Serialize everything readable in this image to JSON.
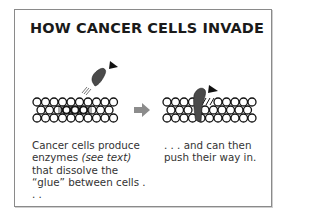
{
  "title": "HOW CANCER CELLS INVADE",
  "panels": [
    {
      "id": "left",
      "caption_parts": {
        "before": "Cancer cells produce enzymes ",
        "italic": "(see text)",
        "after": " that dissolve the “glue” between cells . . ."
      }
    },
    {
      "id": "right",
      "caption": ". . . and can then push their way in."
    }
  ],
  "colors": {
    "border": "#8a8a8a",
    "cancer_cell": "#4a4a4a",
    "arrow": "#8c8c8c",
    "cell_outline": "#111111"
  },
  "icons": {
    "direction_arrow": "gray-right-arrow",
    "movement_pointer": "black-triangle-pointer"
  }
}
